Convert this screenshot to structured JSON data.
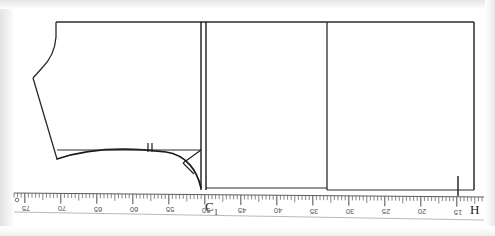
{
  "figure": {
    "kind": "garment-pattern-draft",
    "ink_color": "#1b1b1b",
    "paper_color": "#ffffff",
    "background_color": "#efefef"
  },
  "labels": {
    "point_c1": "C",
    "point_c1_sub": "1",
    "point_h": "H"
  },
  "ruler": {
    "unit": "cm",
    "direction": "decreasing-left-to-right",
    "major_labels": [
      "75",
      "70",
      "65",
      "60",
      "55",
      "50",
      "45",
      "40",
      "35",
      "30",
      "25",
      "20",
      "15"
    ],
    "major_x": [
      26,
      62,
      98,
      134,
      170,
      206,
      242,
      278,
      314,
      350,
      386,
      422,
      458
    ],
    "start_marker": "o",
    "end_marker": "H",
    "minor_per_major": 10,
    "baseline_y": 193,
    "tape_color": "#5d5d5d"
  },
  "construction": {
    "top_line_y": 22,
    "center_front_x": 201,
    "center_front_x2": 206,
    "side_block_left_x": 327,
    "side_block_right_x": 474,
    "waist_y": 188,
    "bust_line_y": 150,
    "notch_marks": 2,
    "notch_x": 149,
    "armhole_curve": "quarter-circle from bust line to waist point",
    "bias_guide": "diagonal from bust corner to curve"
  },
  "bodice_outline": {
    "shoulder_start_x": 56,
    "neck_drop_y": 22,
    "armhole_low_x": 33,
    "hem_point_x": 57,
    "hem_point_y": 159
  }
}
